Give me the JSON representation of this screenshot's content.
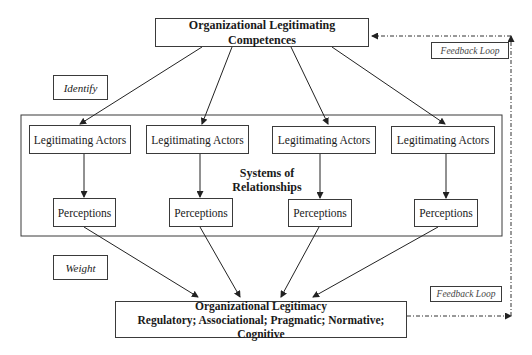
{
  "diagram": {
    "top_box": {
      "label": "Organizational Legitimating Competences"
    },
    "identify_label": "Identify",
    "weight_label": "Weight",
    "feedback_top": "Feedback Loop",
    "feedback_bottom": "Feedback Loop",
    "container_label_line1": "Systems of",
    "container_label_line2": "Relationships",
    "actors": [
      {
        "label": "Legitimating Actors"
      },
      {
        "label": "Legitimating Actors"
      },
      {
        "label": "Legitimating Actors"
      },
      {
        "label": "Legitimating Actors"
      }
    ],
    "perceptions": [
      {
        "label": "Perceptions"
      },
      {
        "label": "Perceptions"
      },
      {
        "label": "Perceptions"
      },
      {
        "label": "Perceptions"
      }
    ],
    "bottom_box": {
      "title": "Organizational Legitimacy",
      "subtitle": "Regulatory; Associational; Pragmatic; Normative; Cognitive"
    }
  }
}
